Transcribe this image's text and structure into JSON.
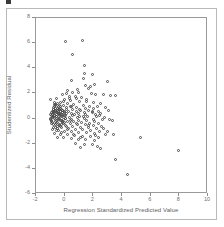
{
  "chart_data": {
    "type": "scatter",
    "title": "",
    "xlabel": "Regression Standardized Predicted Value",
    "ylabel": "Studentized Residual",
    "xlim": [
      -2,
      10
    ],
    "ylim": [
      -6,
      8
    ],
    "xticks": [
      -2,
      0,
      2,
      4,
      6,
      8,
      10
    ],
    "xticklabels": [
      "-2",
      "0",
      "2",
      "4",
      "6",
      "8",
      "10"
    ],
    "yticks": [
      -6,
      -4,
      -2,
      0,
      2,
      4,
      6,
      8
    ],
    "yticklabels": [
      "-6",
      "-4",
      "-2",
      "0",
      "2",
      "4",
      "6",
      "8"
    ],
    "grid": false,
    "legend": false,
    "marker": "open-circle",
    "marker_color": "#4a4a4a",
    "frame_color": "#9a9a9a",
    "points": [
      [
        0.12,
        6.02
      ],
      [
        1.3,
        6.1
      ],
      [
        0.62,
        4.98
      ],
      [
        1.42,
        4.18
      ],
      [
        1.45,
        3.5
      ],
      [
        2.02,
        3.45
      ],
      [
        1.4,
        3.08
      ],
      [
        0.55,
        2.92
      ],
      [
        2.18,
        2.6
      ],
      [
        1.52,
        2.52
      ],
      [
        1.88,
        2.48
      ],
      [
        3.05,
        2.85
      ],
      [
        1.7,
        2.3
      ],
      [
        0.95,
        2.22
      ],
      [
        0.28,
        2.18
      ],
      [
        0.6,
        2.02
      ],
      [
        1.05,
        1.98
      ],
      [
        1.95,
        1.92
      ],
      [
        2.25,
        1.85
      ],
      [
        2.8,
        1.8
      ],
      [
        3.3,
        1.78
      ],
      [
        3.62,
        1.72
      ],
      [
        0.18,
        1.88
      ],
      [
        -0.05,
        1.8
      ],
      [
        0.42,
        1.7
      ],
      [
        0.82,
        1.65
      ],
      [
        1.25,
        1.6
      ],
      [
        -0.48,
        1.52
      ],
      [
        -0.92,
        1.4
      ],
      [
        0.08,
        1.45
      ],
      [
        0.5,
        1.38
      ],
      [
        1.12,
        1.3
      ],
      [
        1.6,
        1.25
      ],
      [
        2.05,
        1.2
      ],
      [
        2.6,
        1.15
      ],
      [
        0.3,
        1.1
      ],
      [
        -0.2,
        1.18
      ],
      [
        -0.62,
        1.05
      ],
      [
        0.7,
        1.02
      ],
      [
        1.35,
        0.98
      ],
      [
        1.8,
        0.92
      ],
      [
        2.35,
        0.88
      ],
      [
        2.9,
        0.82
      ],
      [
        0.02,
        0.95
      ],
      [
        -0.35,
        0.88
      ],
      [
        0.45,
        0.85
      ],
      [
        0.92,
        0.8
      ],
      [
        1.5,
        0.75
      ],
      [
        2.1,
        0.7
      ],
      [
        -0.7,
        0.78
      ],
      [
        -0.25,
        0.72
      ],
      [
        0.22,
        0.68
      ],
      [
        0.65,
        0.62
      ],
      [
        1.18,
        0.58
      ],
      [
        1.72,
        0.55
      ],
      [
        2.45,
        0.5
      ],
      [
        -0.55,
        0.6
      ],
      [
        -0.1,
        0.55
      ],
      [
        0.35,
        0.5
      ],
      [
        0.88,
        0.45
      ],
      [
        1.42,
        0.42
      ],
      [
        2.0,
        0.38
      ],
      [
        2.55,
        0.32
      ],
      [
        -0.8,
        0.48
      ],
      [
        -0.42,
        0.42
      ],
      [
        0.05,
        0.38
      ],
      [
        0.52,
        0.35
      ],
      [
        1.02,
        0.3
      ],
      [
        1.55,
        0.28
      ],
      [
        2.2,
        0.22
      ],
      [
        -0.68,
        0.3
      ],
      [
        -0.3,
        0.25
      ],
      [
        0.15,
        0.2
      ],
      [
        0.6,
        0.18
      ],
      [
        1.1,
        0.12
      ],
      [
        1.65,
        0.08
      ],
      [
        2.3,
        0.05
      ],
      [
        2.85,
        0.02
      ],
      [
        -0.88,
        0.18
      ],
      [
        -0.5,
        0.12
      ],
      [
        -0.05,
        0.08
      ],
      [
        0.4,
        0.02
      ],
      [
        0.95,
        -0.02
      ],
      [
        1.45,
        -0.08
      ],
      [
        2.05,
        -0.12
      ],
      [
        2.7,
        -0.18
      ],
      [
        3.2,
        -0.15
      ],
      [
        -0.75,
        0.02
      ],
      [
        -0.38,
        -0.05
      ],
      [
        0.1,
        -0.1
      ],
      [
        0.55,
        -0.15
      ],
      [
        1.05,
        -0.2
      ],
      [
        1.58,
        -0.25
      ],
      [
        2.15,
        -0.3
      ],
      [
        -0.6,
        -0.18
      ],
      [
        -0.22,
        -0.25
      ],
      [
        0.25,
        -0.3
      ],
      [
        0.72,
        -0.35
      ],
      [
        1.22,
        -0.4
      ],
      [
        1.78,
        -0.45
      ],
      [
        2.4,
        -0.48
      ],
      [
        -0.85,
        -0.32
      ],
      [
        -0.45,
        -0.4
      ],
      [
        0.0,
        -0.45
      ],
      [
        0.48,
        -0.5
      ],
      [
        0.98,
        -0.55
      ],
      [
        1.5,
        -0.58
      ],
      [
        2.08,
        -0.62
      ],
      [
        2.62,
        -0.68
      ],
      [
        -0.7,
        -0.55
      ],
      [
        -0.28,
        -0.62
      ],
      [
        0.18,
        -0.68
      ],
      [
        0.65,
        -0.72
      ],
      [
        1.15,
        -0.78
      ],
      [
        1.7,
        -0.82
      ],
      [
        2.28,
        -0.88
      ],
      [
        -0.55,
        -0.75
      ],
      [
        -0.12,
        -0.82
      ],
      [
        0.32,
        -0.88
      ],
      [
        0.82,
        -0.92
      ],
      [
        1.32,
        -0.98
      ],
      [
        1.9,
        -1.02
      ],
      [
        2.48,
        -1.08
      ],
      [
        3.05,
        -1.12
      ],
      [
        -0.78,
        -0.95
      ],
      [
        -0.38,
        -1.02
      ],
      [
        0.08,
        -1.08
      ],
      [
        0.55,
        -1.12
      ],
      [
        1.05,
        -1.18
      ],
      [
        1.6,
        -1.22
      ],
      [
        2.18,
        -1.28
      ],
      [
        2.95,
        -1.32
      ],
      [
        3.45,
        -1.38
      ],
      [
        -0.62,
        -1.25
      ],
      [
        -0.2,
        -1.32
      ],
      [
        0.28,
        -1.38
      ],
      [
        0.78,
        -1.42
      ],
      [
        1.28,
        -1.48
      ],
      [
        1.85,
        -1.52
      ],
      [
        2.42,
        -1.58
      ],
      [
        -0.45,
        -1.55
      ],
      [
        0.02,
        -1.62
      ],
      [
        0.52,
        -1.68
      ],
      [
        1.02,
        -1.72
      ],
      [
        1.55,
        -1.78
      ],
      [
        2.12,
        -1.82
      ],
      [
        0.85,
        -2.05
      ],
      [
        1.48,
        -2.12
      ],
      [
        2.0,
        -2.18
      ],
      [
        2.35,
        -2.28
      ],
      [
        1.18,
        -2.35
      ],
      [
        2.55,
        -2.45
      ],
      [
        3.62,
        -3.35
      ],
      [
        4.48,
        -4.5
      ],
      [
        5.38,
        -1.62
      ],
      [
        7.98,
        -2.58
      ],
      [
        -0.65,
        1.22
      ],
      [
        -0.58,
        0.95
      ],
      [
        -0.72,
        0.65
      ],
      [
        -0.95,
        0.22
      ],
      [
        -0.9,
        -0.15
      ],
      [
        -0.82,
        -0.48
      ],
      [
        -0.68,
        -0.78
      ],
      [
        -0.52,
        -1.05
      ],
      [
        -0.42,
        1.15
      ],
      [
        -0.35,
        0.32
      ],
      [
        -0.28,
        -0.52
      ],
      [
        -0.18,
        -1.18
      ],
      [
        -0.15,
        0.62
      ],
      [
        -0.08,
        -0.32
      ],
      [
        0.02,
        1.25
      ],
      [
        0.12,
        -0.62
      ],
      [
        0.2,
        0.78
      ],
      [
        0.3,
        -0.95
      ],
      [
        0.38,
        1.48
      ],
      [
        0.45,
        -0.25
      ],
      [
        0.58,
        0.88
      ],
      [
        0.68,
        -1.35
      ],
      [
        0.75,
        0.25
      ],
      [
        0.88,
        1.55
      ],
      [
        0.92,
        -0.45
      ],
      [
        1.08,
        0.68
      ],
      [
        1.2,
        -1.55
      ],
      [
        1.38,
        0.12
      ],
      [
        1.62,
        1.42
      ],
      [
        1.75,
        -0.65
      ],
      [
        1.98,
        0.52
      ],
      [
        2.22,
        -1.42
      ],
      [
        2.5,
        0.18
      ],
      [
        2.75,
        -0.85
      ],
      [
        3.12,
        0.55
      ],
      [
        3.38,
        -0.25
      ],
      [
        -0.48,
        0.05
      ],
      [
        -0.52,
        0.38
      ],
      [
        -0.58,
        -0.35
      ],
      [
        -0.62,
        0.18
      ],
      [
        -0.38,
        0.52
      ],
      [
        -0.32,
        -0.08
      ],
      [
        -0.25,
        0.88
      ],
      [
        -0.42,
        -0.68
      ],
      [
        -0.22,
        0.45
      ],
      [
        -0.15,
        -0.55
      ],
      [
        -0.05,
        0.25
      ],
      [
        0.05,
        -0.42
      ],
      [
        -0.48,
        -0.22
      ],
      [
        -0.35,
        0.68
      ],
      [
        -0.55,
        0.48
      ],
      [
        -0.65,
        -0.05
      ],
      [
        -0.72,
        0.38
      ],
      [
        -0.45,
        0.72
      ],
      [
        -0.28,
        0.15
      ],
      [
        -0.18,
        -0.25
      ],
      [
        -0.08,
        0.58
      ],
      [
        -0.58,
        -0.58
      ],
      [
        -0.68,
        0.12
      ],
      [
        -0.75,
        -0.38
      ],
      [
        -0.4,
        -0.88
      ],
      [
        -0.3,
        0.98
      ],
      [
        -0.2,
        -0.72
      ],
      [
        -0.1,
        0.42
      ],
      [
        -0.5,
        0.28
      ],
      [
        -0.6,
        0.72
      ],
      [
        -0.7,
        0.52
      ],
      [
        -0.8,
        0.08
      ],
      [
        -0.85,
        -0.22
      ],
      [
        -0.78,
        0.28
      ],
      [
        -0.52,
        -0.45
      ],
      [
        -0.32,
        0.35
      ],
      [
        -0.12,
        0.12
      ],
      [
        -0.02,
        -0.18
      ],
      [
        0.08,
        0.48
      ],
      [
        0.15,
        -0.08
      ],
      [
        0.22,
        0.32
      ],
      [
        -0.44,
        0.58
      ],
      [
        -0.36,
        -0.15
      ],
      [
        -0.26,
        0.62
      ],
      [
        -0.16,
        0.22
      ],
      [
        -0.06,
        -0.38
      ],
      [
        0.03,
        0.15
      ],
      [
        -0.66,
        0.88
      ],
      [
        -0.74,
        0.62
      ],
      [
        -0.86,
        0.42
      ],
      [
        -0.92,
        -0.05
      ],
      [
        -0.58,
        1.05
      ]
    ]
  }
}
